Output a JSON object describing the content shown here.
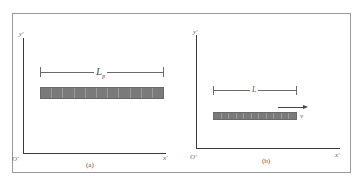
{
  "figure": {
    "topic": "length contraction",
    "colors": {
      "frame": "#9a9a9a",
      "axis": "#3a3a3a",
      "rod_fill": "#7a7a7a",
      "rod_segment_line": "#9a9a9a",
      "text": "#555555"
    },
    "panels": [
      {
        "id": "a",
        "caption": "(a)",
        "axes": {
          "y_label": "y'",
          "x_label": "x'",
          "origin_label": "O'"
        },
        "rod": {
          "segments": 11,
          "moving": false
        },
        "dimension": {
          "label_main": "L",
          "label_sub": "p"
        }
      },
      {
        "id": "b",
        "caption": "(b)",
        "axes": {
          "y_label": "y'",
          "x_label": "x'",
          "origin_label": "O'"
        },
        "rod": {
          "segments": 11,
          "moving": true
        },
        "dimension": {
          "label_main": "L",
          "label_sub": ""
        },
        "velocity": {
          "label": "v",
          "direction": "right"
        }
      }
    ]
  }
}
